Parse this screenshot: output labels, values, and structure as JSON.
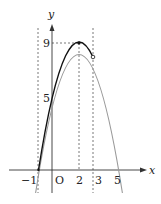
{
  "diagram": {
    "function": "y = -(x-2)^2 + 9",
    "axes": {
      "x_label": "x",
      "y_label": "y",
      "origin_label": "O"
    },
    "x_ticks": [
      {
        "value": -1,
        "label": "−1"
      },
      {
        "value": 2,
        "label": "2"
      },
      {
        "value": 3,
        "label": "3"
      },
      {
        "value": 5,
        "label": "5"
      }
    ],
    "y_ticks": [
      {
        "value": 5,
        "label": "5"
      },
      {
        "value": 9,
        "label": "9"
      }
    ],
    "vertex": {
      "x": 2,
      "y": 9
    },
    "open_point": {
      "x": 3,
      "y": 8
    },
    "dashed_verticals": [
      -1,
      2,
      3
    ],
    "colors": {
      "solid_curve": "#111111",
      "faded_curve": "#9a9a9a",
      "axis": "#333333",
      "dashed": "#555555"
    }
  }
}
